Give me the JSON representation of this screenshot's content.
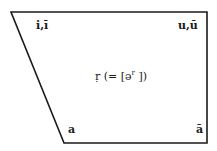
{
  "diagram": {
    "type": "vowel-space trapezoid",
    "shape_color": "#1a1a1a",
    "corners": {
      "top_left": "i,ī",
      "top_right": "u,ū",
      "bottom_left": "a",
      "bottom_right": "ā"
    },
    "center": {
      "symbol": "ṛ",
      "open": "(= [ə",
      "sup": "r",
      "close": " ])"
    }
  }
}
